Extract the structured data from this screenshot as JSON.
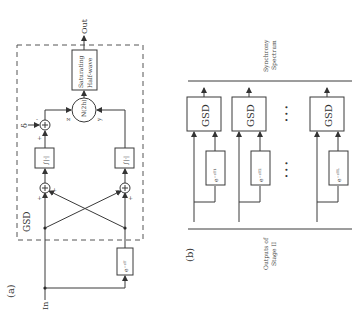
{
  "panel_a": {
    "label": "(a)",
    "block_label": "GSD",
    "input_label": "In",
    "output_label": "Out",
    "saturating_block": {
      "line1": "Saturating",
      "line2": "Half-wave"
    },
    "nonlinear_block": "N(2h)",
    "delta_label": "δ",
    "signal_z": "z",
    "signal_y": "y",
    "integrator_label": "∫|·|",
    "delay_label": "e⁻ˢᵀ",
    "signs": {
      "top_minus": "-",
      "top_plus": "+",
      "lower_left_plus1": "+",
      "lower_left_plus2": "+",
      "lower_right_minus": "-",
      "lower_right_plus": "+"
    }
  },
  "panel_b": {
    "label": "(b)",
    "top_label_line1": "Synchrony",
    "top_label_line2": "Spectrum",
    "bottom_label_line1": "Outputs of",
    "bottom_label_line2": "Stage II",
    "gsd_blocks": [
      "GSD",
      "GSD",
      "GSD"
    ],
    "delay_blocks": [
      "e⁻ˢᵀ¹",
      "e⁻ˢᵀ²",
      "e⁻ˢᵀᴸ"
    ],
    "ellipsis": "• • •"
  }
}
